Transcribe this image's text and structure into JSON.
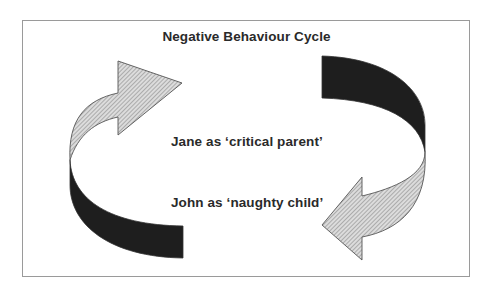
{
  "diagram": {
    "title": "Negative Behaviour Cycle",
    "labels": {
      "top": "Jane as ‘critical parent’",
      "bottom": "John as ‘naughty child’"
    },
    "arrows": [
      {
        "id": "left",
        "direction": "up-then-right",
        "from": "John as 'naughty child'",
        "to": "Jane as 'critical parent'"
      },
      {
        "id": "right",
        "direction": "down-then-left",
        "from": "Jane as 'critical parent'",
        "to": "John as 'naughty child'"
      }
    ],
    "colors": {
      "dark_band": "#1e1e1e",
      "hatch_fill": "#d6d6d6",
      "hatch_line": "#7a7a7a",
      "outline": "#555555",
      "frame": "#9a9a9a",
      "text": "#2a2a2a"
    }
  }
}
